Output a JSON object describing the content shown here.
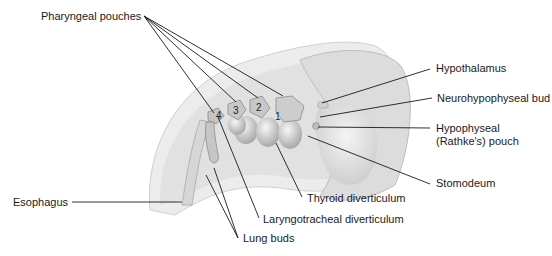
{
  "figure": {
    "labels": {
      "pharyngeal_pouches": "Pharyngeal pouches",
      "hypothalamus": "Hypothalamus",
      "neurohypophyseal_bud": "Neurohypophyseal bud",
      "hypophyseal_pouch_line1": "Hypophyseal",
      "hypophyseal_pouch_line2": "(Rathke's) pouch",
      "stomodeum": "Stomodeum",
      "thyroid_diverticulum": "Thyroid diverticulum",
      "laryngotracheal_diverticulum": "Laryngotracheal diverticulum",
      "lung_buds": "Lung buds",
      "esophagus": "Esophagus"
    },
    "pouch_numbers": [
      "1",
      "2",
      "3",
      "4"
    ],
    "colors": {
      "line": "#1a1a1a",
      "tissue_light": "#e6e6e6",
      "tissue_mid": "#c8c8c8",
      "tissue_dark": "#9a9a9a"
    }
  }
}
